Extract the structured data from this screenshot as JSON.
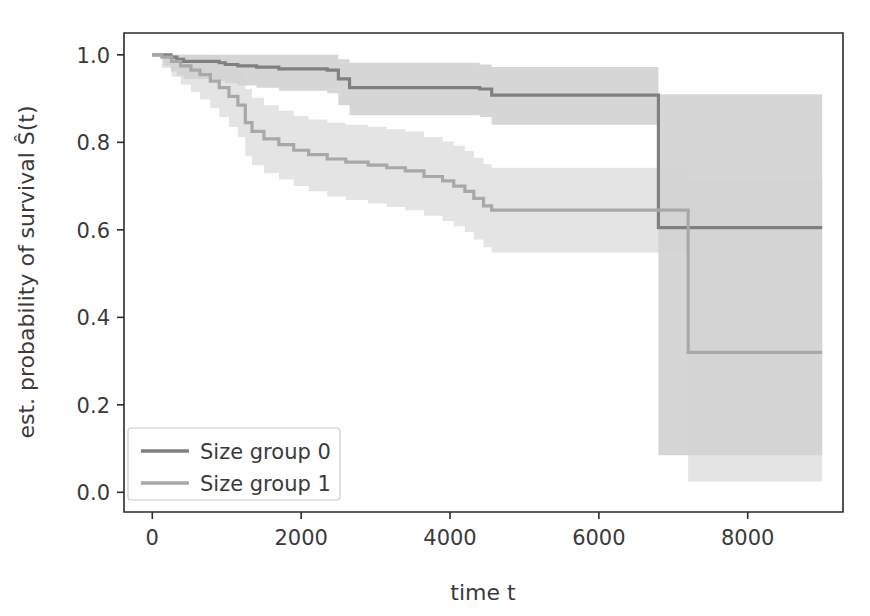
{
  "chart_data": {
    "type": "line",
    "title": "",
    "subtitle": "",
    "xlabel": "time t",
    "ylabel": "est. probability of survival Ŝ(t)",
    "xlim": [
      -380,
      9280
    ],
    "ylim": [
      -0.045,
      1.05
    ],
    "xticks": [
      0,
      2000,
      4000,
      6000,
      8000
    ],
    "xtick_labels": [
      "0",
      "2000",
      "4000",
      "6000",
      "8000"
    ],
    "yticks": [
      0.0,
      0.2,
      0.4,
      0.6,
      0.8,
      1.0
    ],
    "ytick_labels": [
      "0.0",
      "0.2",
      "0.4",
      "0.6",
      "0.8",
      "1.0"
    ],
    "grid": false,
    "legend_position": "lower left",
    "step_mode": "post",
    "confidence_band": true,
    "series": [
      {
        "name": "Size group 0",
        "color": "#808080",
        "band_color": "#b4b4b4",
        "band_opacity": 0.55,
        "x": [
          0,
          150,
          250,
          330,
          420,
          900,
          980,
          1150,
          1400,
          1700,
          2350,
          2500,
          2650,
          4400,
          4560,
          6800,
          9000
        ],
        "y": [
          1.0,
          1.0,
          0.995,
          0.99,
          0.985,
          0.982,
          0.978,
          0.975,
          0.972,
          0.968,
          0.965,
          0.945,
          0.925,
          0.922,
          0.908,
          0.605,
          0.605
        ],
        "y_lower": [
          1.0,
          0.975,
          0.962,
          0.952,
          0.945,
          0.94,
          0.935,
          0.93,
          0.925,
          0.918,
          0.912,
          0.885,
          0.862,
          0.858,
          0.84,
          0.085,
          0.085
        ],
        "y_upper": [
          1.0,
          1.0,
          1.0,
          1.0,
          1.0,
          1.0,
          1.0,
          1.0,
          1.0,
          1.0,
          1.0,
          0.99,
          0.982,
          0.978,
          0.972,
          0.91,
          0.91
        ]
      },
      {
        "name": "Size group 1",
        "color": "#a8a8a8",
        "band_color": "#d2d2d2",
        "band_opacity": 0.6,
        "x": [
          0,
          130,
          260,
          380,
          520,
          640,
          780,
          900,
          1030,
          1150,
          1250,
          1340,
          1500,
          1700,
          1900,
          2100,
          2350,
          2600,
          2900,
          3150,
          3400,
          3650,
          3900,
          4050,
          4200,
          4320,
          4450,
          4560,
          7200,
          9000
        ],
        "y": [
          1.0,
          0.995,
          0.985,
          0.975,
          0.965,
          0.955,
          0.94,
          0.925,
          0.905,
          0.885,
          0.845,
          0.825,
          0.808,
          0.795,
          0.782,
          0.772,
          0.762,
          0.755,
          0.748,
          0.742,
          0.735,
          0.722,
          0.712,
          0.7,
          0.688,
          0.672,
          0.655,
          0.645,
          0.32,
          0.32
        ],
        "y_lower": [
          1.0,
          0.97,
          0.95,
          0.932,
          0.915,
          0.898,
          0.878,
          0.858,
          0.835,
          0.812,
          0.768,
          0.748,
          0.73,
          0.715,
          0.7,
          0.688,
          0.676,
          0.668,
          0.66,
          0.652,
          0.645,
          0.632,
          0.62,
          0.608,
          0.595,
          0.578,
          0.56,
          0.548,
          0.025,
          0.025
        ],
        "y_upper": [
          1.0,
          1.0,
          1.0,
          1.0,
          1.0,
          1.0,
          0.998,
          0.99,
          0.975,
          0.958,
          0.922,
          0.902,
          0.885,
          0.872,
          0.86,
          0.852,
          0.845,
          0.84,
          0.835,
          0.83,
          0.825,
          0.812,
          0.802,
          0.792,
          0.78,
          0.765,
          0.75,
          0.742,
          0.715,
          0.715
        ]
      }
    ],
    "legend": [
      {
        "label": "Size group 0",
        "color": "#808080"
      },
      {
        "label": "Size group 1",
        "color": "#a8a8a8"
      }
    ]
  },
  "axes": {
    "x_label": "time t",
    "y_label": "est. probability of survival Ŝ(t)"
  }
}
